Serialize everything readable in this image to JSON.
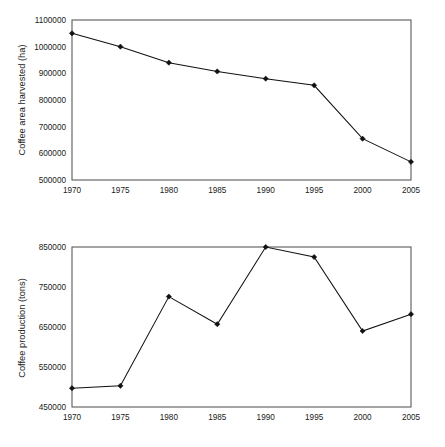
{
  "figures": [
    {
      "id": "coffee-area-harvested",
      "ylabel": "Coffee area harvested (ha)",
      "ytick_labels": [
        "1100000",
        "1000000",
        "900000",
        "800000",
        "700000",
        "600000",
        "500000"
      ],
      "xtick_labels": [
        "1970",
        "1975",
        "1980",
        "1985",
        "1990",
        "1995",
        "2000",
        "2005"
      ]
    },
    {
      "id": "coffee-production",
      "ylabel": "Coffee production (tons)",
      "ytick_labels": [
        "850000",
        "750000",
        "650000",
        "550000",
        "450000"
      ],
      "xtick_labels": [
        "1970",
        "1975",
        "1980",
        "1985",
        "1990",
        "1995",
        "2000",
        "2005"
      ]
    }
  ],
  "chart_data": [
    {
      "type": "line",
      "title": "",
      "xlabel": "",
      "ylabel": "Coffee area harvested (ha)",
      "x": [
        1970,
        1975,
        1980,
        1985,
        1990,
        1995,
        2000,
        2005
      ],
      "categories": [
        "1970",
        "1975",
        "1980",
        "1985",
        "1990",
        "1995",
        "2000",
        "2005"
      ],
      "values": [
        1050000,
        1000000,
        940000,
        907000,
        880000,
        855000,
        655000,
        568000
      ],
      "xlim": [
        1970,
        2005
      ],
      "ylim": [
        500000,
        1100000
      ],
      "ytick_values": [
        500000,
        600000,
        700000,
        800000,
        900000,
        1000000,
        1100000
      ],
      "xtick_values": [
        1970,
        1975,
        1980,
        1985,
        1990,
        1995,
        2000,
        2005
      ],
      "grid": false,
      "legend": false,
      "marker": "filled-diamond",
      "line_color": "#111111"
    },
    {
      "type": "line",
      "title": "",
      "xlabel": "",
      "ylabel": "Coffee production (tons)",
      "x": [
        1970,
        1975,
        1980,
        1985,
        1990,
        1995,
        2000,
        2005
      ],
      "categories": [
        "1970",
        "1975",
        "1980",
        "1985",
        "1990",
        "1995",
        "2000",
        "2005"
      ],
      "values": [
        497000,
        503000,
        726000,
        657000,
        850000,
        825000,
        640000,
        682000
      ],
      "xlim": [
        1970,
        2005
      ],
      "ylim": [
        450000,
        850000
      ],
      "ytick_values": [
        450000,
        550000,
        650000,
        750000,
        850000
      ],
      "xtick_values": [
        1970,
        1975,
        1980,
        1985,
        1990,
        1995,
        2000,
        2005
      ],
      "grid": false,
      "legend": false,
      "marker": "filled-diamond",
      "line_color": "#111111"
    }
  ]
}
